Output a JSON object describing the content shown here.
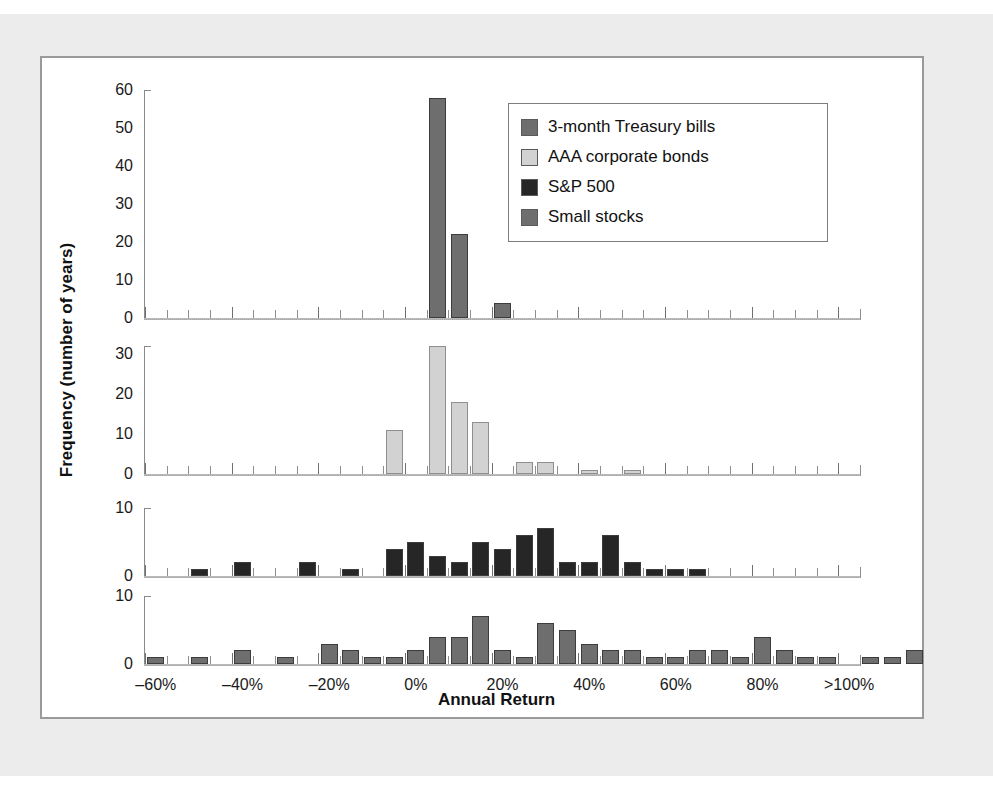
{
  "chart_data": {
    "type": "bar",
    "title": "",
    "xlabel": "Annual Return",
    "ylabel": "Frequency (number of years)",
    "grid": false,
    "legend_position": "top-right",
    "bin_width_pct": 5,
    "x_range_pct": [
      -62.5,
      102.5
    ],
    "xtick_labels": [
      "–60%",
      "–40%",
      "–20%",
      "0%",
      "20%",
      "40%",
      "60%",
      "80%",
      ">100%"
    ],
    "xtick_values": [
      -60,
      -40,
      -20,
      0,
      20,
      40,
      60,
      80,
      100
    ],
    "bin_centers": [
      -60,
      -55,
      -50,
      -45,
      -40,
      -35,
      -30,
      -25,
      -20,
      -15,
      -10,
      -5,
      0,
      5,
      10,
      15,
      20,
      25,
      30,
      35,
      40,
      45,
      50,
      55,
      60,
      65,
      70,
      75,
      80,
      85,
      90,
      95,
      100
    ],
    "panels": [
      {
        "name": "3-month Treasury bills",
        "color": "#6e6e6e",
        "ylim": [
          0,
          60
        ],
        "yticks": [
          0,
          10,
          20,
          30,
          40,
          50,
          60
        ],
        "ytick_labels": [
          "0",
          "10",
          "20",
          "30",
          "40",
          "50",
          "60"
        ],
        "values": [
          0,
          0,
          0,
          0,
          0,
          0,
          0,
          0,
          0,
          0,
          0,
          0,
          0,
          58,
          22,
          0,
          4,
          0,
          0,
          0,
          0,
          0,
          0,
          0,
          0,
          0,
          0,
          0,
          0,
          0,
          0,
          0,
          0
        ]
      },
      {
        "name": "AAA corporate bonds",
        "color": "#d2d2d2",
        "ylim": [
          0,
          32
        ],
        "yticks": [
          0,
          10,
          20,
          30
        ],
        "ytick_labels": [
          "0",
          "10",
          "20",
          "30"
        ],
        "values": [
          0,
          0,
          0,
          0,
          0,
          0,
          0,
          0,
          0,
          0,
          0,
          11,
          0,
          32,
          18,
          13,
          0,
          3,
          3,
          0,
          1,
          0,
          1,
          0,
          0,
          0,
          0,
          0,
          0,
          0,
          0,
          0,
          0
        ]
      },
      {
        "name": "S&P 500",
        "color": "#262626",
        "ylim": [
          0,
          10
        ],
        "yticks": [
          0,
          10
        ],
        "ytick_labels": [
          "0",
          "10"
        ],
        "values": [
          0,
          0,
          1,
          0,
          2,
          0,
          0,
          2,
          0,
          1,
          0,
          4,
          5,
          3,
          2,
          5,
          4,
          6,
          7,
          2,
          2,
          6,
          2,
          1,
          1,
          1,
          0,
          0,
          0,
          0,
          0,
          0,
          0
        ]
      },
      {
        "name": "Small stocks",
        "color": "#6e6e6e",
        "ylim": [
          0,
          10
        ],
        "yticks": [
          0,
          10
        ],
        "ytick_labels": [
          "0",
          "10"
        ],
        "values": [
          1,
          0,
          1,
          0,
          2,
          0,
          1,
          0,
          3,
          2,
          1,
          1,
          2,
          4,
          4,
          7,
          2,
          1,
          6,
          5,
          3,
          2,
          2,
          1,
          1,
          2,
          2,
          1,
          4,
          2,
          1,
          1,
          0,
          1,
          1,
          2
        ]
      }
    ]
  },
  "legend": {
    "items": [
      {
        "label": "3-month Treasury bills",
        "color": "#6e6e6e"
      },
      {
        "label": "AAA corporate bonds",
        "color": "#d2d2d2"
      },
      {
        "label": "S&P 500",
        "color": "#262626"
      },
      {
        "label": "Small stocks",
        "color": "#6e6e6e"
      }
    ]
  }
}
